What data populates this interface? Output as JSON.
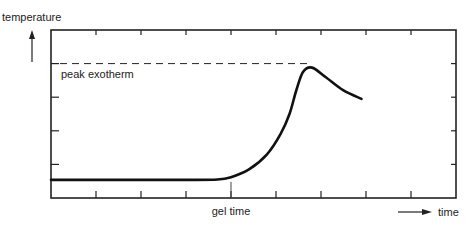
{
  "chart_data": {
    "type": "line",
    "title": "",
    "xlabel": "time",
    "ylabel": "temperature",
    "xlim": [
      0,
      9
    ],
    "ylim": [
      0,
      5
    ],
    "x_ticks": [
      1,
      2,
      3,
      4,
      5,
      6,
      7,
      8
    ],
    "y_ticks": [
      1,
      2,
      3,
      4
    ],
    "tick_labels_shown": false,
    "grid": false,
    "series": [
      {
        "name": "cure temperature",
        "x": [
          0,
          1,
          2,
          3,
          3.7,
          4.0,
          4.4,
          4.8,
          5.1,
          5.3,
          5.45,
          5.6,
          5.8,
          6.1,
          6.5,
          6.9
        ],
        "y": [
          0.54,
          0.54,
          0.54,
          0.54,
          0.55,
          0.62,
          0.85,
          1.3,
          1.9,
          2.5,
          3.2,
          3.75,
          3.88,
          3.6,
          3.2,
          2.95
        ]
      }
    ],
    "annotations": [
      {
        "text": "peak exotherm",
        "type": "hline",
        "y": 4.0,
        "x_end": 5.8,
        "style": "dashed"
      },
      {
        "text": "gel time",
        "type": "vline-marker",
        "x": 4.0
      }
    ],
    "axis_arrows": {
      "y_arrow_label": "temperature",
      "x_arrow_label": "time"
    }
  }
}
